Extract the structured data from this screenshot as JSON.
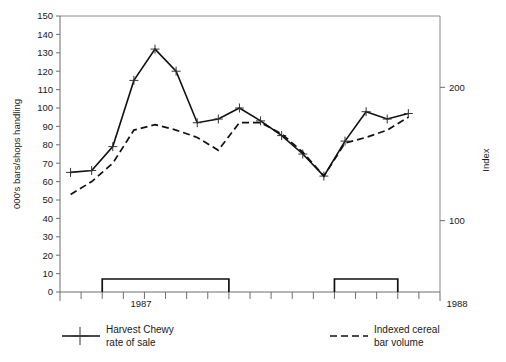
{
  "chart_data": {
    "type": "line",
    "title": "",
    "xlabel": "",
    "ylabel": "000's bars/shops handling",
    "y2label": "Index",
    "ylim": [
      0,
      150
    ],
    "y2lim": [
      46.5,
      253.5
    ],
    "grid": false,
    "legend_position": "below-plot",
    "y_ticks": [
      0,
      10,
      20,
      30,
      40,
      50,
      60,
      70,
      80,
      90,
      100,
      110,
      120,
      130,
      140,
      150
    ],
    "y2_ticks": [
      100,
      200
    ],
    "x_tick_count": 18,
    "x_tick_labels": [
      "1987",
      "1988"
    ],
    "x": [
      0,
      1,
      2,
      3,
      4,
      5,
      6,
      7,
      8,
      9,
      10,
      11,
      12,
      13,
      14,
      15,
      16
    ],
    "series": [
      {
        "name": "Harvest Chewy rate of sale",
        "style": "solid",
        "marker": "plus",
        "axis": "left",
        "values": [
          65,
          66,
          79,
          115,
          132,
          120,
          92,
          94,
          100,
          93,
          85,
          75,
          63,
          82,
          98,
          94,
          97
        ]
      },
      {
        "name": "Indexed cereal bar volume",
        "style": "dashed",
        "marker": "none",
        "axis": "right",
        "values": [
          53,
          60,
          70,
          88,
          91,
          88,
          84,
          77,
          92,
          92,
          86,
          76,
          63,
          81,
          84,
          88,
          95
        ]
      }
    ],
    "period_brackets": [
      {
        "start_tick": 2,
        "end_tick": 8
      },
      {
        "start_tick": 13,
        "end_tick": 16
      }
    ]
  },
  "axes": {
    "y_label": "000's bars/shops handling",
    "y2_label": "Index",
    "y_ticks": [
      "150",
      "140",
      "130",
      "120",
      "110",
      "100",
      "90",
      "80",
      "70",
      "60",
      "50",
      "40",
      "30",
      "20",
      "10",
      "0"
    ],
    "y2_ticks": [
      "200",
      "100"
    ],
    "x_label_left": "1987",
    "x_label_right": "1988"
  },
  "legend": {
    "entries": [
      {
        "label_line1": "Harvest Chewy",
        "label_line2": "rate of sale",
        "style": "solid-plus"
      },
      {
        "label_line1": "Indexed cereal",
        "label_line2": "bar volume",
        "style": "dashed"
      }
    ]
  },
  "colors": {
    "line": "#111111",
    "axis": "#6e6e6e",
    "frame": "#8a8a8a",
    "text": "#1a1a1a",
    "background": "#ffffff"
  }
}
